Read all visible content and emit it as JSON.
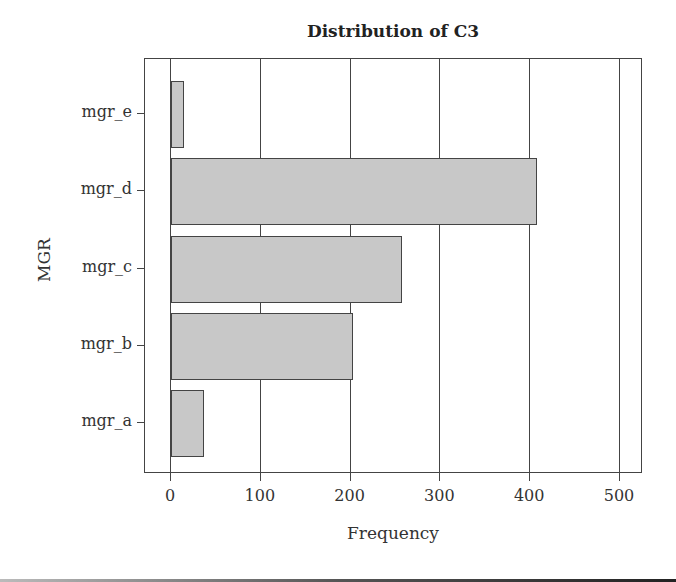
{
  "chart_data": {
    "type": "bar",
    "orientation": "horizontal",
    "title": "Distribution of C3",
    "xlabel": "Frequency",
    "ylabel": "MGR",
    "categories": [
      "mgr_a",
      "mgr_b",
      "mgr_c",
      "mgr_d",
      "mgr_e"
    ],
    "values": [
      37,
      203,
      257,
      408,
      14
    ],
    "xlim": [
      -28,
      527
    ],
    "xticks": [
      0,
      100,
      200,
      300,
      400,
      500
    ],
    "grid": "vertical",
    "bar_color": "#c8c8c8",
    "legend": null
  },
  "labels": {
    "title": "Distribution of C3",
    "xlabel": "Frequency",
    "ylabel": "MGR",
    "xticks": [
      "0",
      "100",
      "200",
      "300",
      "400",
      "500"
    ],
    "yticks": [
      "mgr_e",
      "mgr_d",
      "mgr_c",
      "mgr_b",
      "mgr_a"
    ]
  }
}
